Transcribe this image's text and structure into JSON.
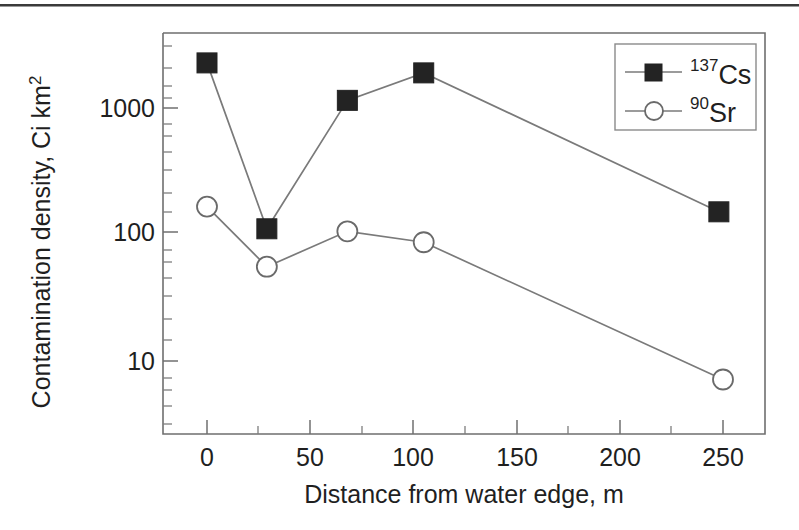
{
  "chart_data": {
    "type": "line",
    "title": "",
    "xlabel": "Distance from water edge, m",
    "ylabel": "Contamination density, Ci km",
    "ylabel_exponent": "2",
    "xlim": [
      -15,
      278
    ],
    "ylim": [
      1.8,
      5500
    ],
    "yscale": "log",
    "xscale": "linear",
    "grid": false,
    "legend_position": "top-right",
    "xticks": [
      0,
      50,
      100,
      150,
      200,
      250
    ],
    "xticklabels": [
      "0",
      "50",
      "100",
      "150",
      "200",
      "250"
    ],
    "yticks": [
      10,
      100,
      1000
    ],
    "yticklabels": [
      "10",
      "100",
      "1000"
    ],
    "series": [
      {
        "name": "Cs",
        "name_superscript": "137",
        "marker": "filled-square",
        "x": [
          0,
          29,
          68,
          105,
          248
        ],
        "values": [
          2280,
          110,
          1150,
          1900,
          150
        ]
      },
      {
        "name": "Sr",
        "name_superscript": "90",
        "marker": "open-circle",
        "x": [
          0,
          29,
          68,
          105,
          250
        ],
        "values": [
          165,
          55,
          105,
          86,
          7
        ]
      }
    ],
    "colors": {
      "marker_filled": "#232323",
      "marker_open_stroke": "#6a6a6a",
      "line": "#7a7a7a",
      "axis": "#6f6f6f",
      "text": "#1f1f1f",
      "background": "#ffffff"
    }
  }
}
